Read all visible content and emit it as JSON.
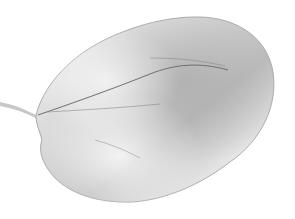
{
  "image": {
    "subject": "leaf",
    "description": "Grayscale photograph of a single oval leaf with short stem on white background",
    "colors": {
      "background": "#ffffff",
      "leaf_light": "#eeeeee",
      "leaf_mid": "#c4c4c4",
      "leaf_dark": "#9a9a9a",
      "vein": "#6f6f6f",
      "edge": "#8c8c8c"
    }
  }
}
